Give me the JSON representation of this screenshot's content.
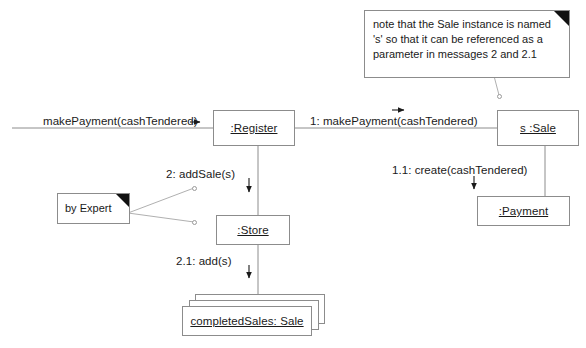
{
  "diagram": {
    "type": "uml-communication-diagram",
    "line_color": "#8c8c8c",
    "text_color": "#1a1a1a",
    "background": "#ffffff"
  },
  "objects": [
    {
      "id": "register",
      "label": ":Register"
    },
    {
      "id": "sale",
      "label": "s :Sale"
    },
    {
      "id": "store",
      "label": ":Store"
    },
    {
      "id": "payment",
      "label": ":Payment"
    },
    {
      "id": "completed_sales",
      "label": "completedSales: Sale"
    }
  ],
  "messages": [
    {
      "id": "found",
      "label": "makePayment(cashTendered)"
    },
    {
      "id": "m1",
      "label": "1: makePayment(cashTendered)"
    },
    {
      "id": "m11",
      "label": "1.1: create(cashTendered)"
    },
    {
      "id": "m2",
      "label": "2: addSale(s)"
    },
    {
      "id": "m21",
      "label": "2.1: add(s)"
    }
  ],
  "notes": [
    {
      "id": "sale-note",
      "lines": [
        "note that the Sale instance is named",
        "'s' so that it can be referenced as a",
        "parameter in messages 2 and 2.1"
      ]
    },
    {
      "id": "expert-note",
      "lines": [
        "by Expert"
      ]
    }
  ]
}
